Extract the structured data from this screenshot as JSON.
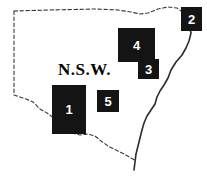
{
  "figure": {
    "name": "new-south-wales-region-map",
    "width": 207,
    "height": 177,
    "background_color": "#ffffff",
    "outline_color": "#3a3a3a",
    "box_color": "#141414",
    "label_color": "#ffffff"
  },
  "state_label": {
    "text": "N.S.W.",
    "x": 58,
    "y": 60
  },
  "regions": [
    {
      "id": "region-1",
      "label": "1",
      "x": 52,
      "y": 85,
      "width": 34,
      "height": 49
    },
    {
      "id": "region-2",
      "label": "2",
      "x": 181,
      "y": 7,
      "width": 21,
      "height": 24
    },
    {
      "id": "region-3",
      "label": "3",
      "x": 138,
      "y": 59,
      "width": 21,
      "height": 20
    },
    {
      "id": "region-4",
      "label": "4",
      "x": 118,
      "y": 28,
      "width": 37,
      "height": 34
    },
    {
      "id": "region-5",
      "label": "5",
      "x": 97,
      "y": 90,
      "width": 22,
      "height": 22
    }
  ],
  "borders": {
    "northern_border": "M 14,11 L 50,10 L 95,9 L 118,10 L 131,12 L 140,14 L 148,13 L 158,9 L 168,7 L 177,8 L 181,11",
    "western_border": "M 14,11 L 14,95",
    "southwestern_border": "M 14,95 L 20,97 L 26,99 L 33,102 L 40,109 L 47,113 L 54,118 L 60,124 L 66,129 L 72,133",
    "southern_border": "M 72,133 L 80,135 L 88,134 L 95,136 L 101,141 L 108,146 L 116,150 L 124,154 L 131,158 L 136,161",
    "coastline": "M 183,9 L 186,16 L 189,24 L 191,33 L 189,41 L 186,48 L 182,55 L 176,62 L 171,70 L 168,78 L 164,85 L 160,91 L 157,97 L 155,104 L 151,110 L 147,116 L 144,123 L 142,130 L 140,138 L 138,146 L 136,154 L 135,162 L 134,170"
  }
}
